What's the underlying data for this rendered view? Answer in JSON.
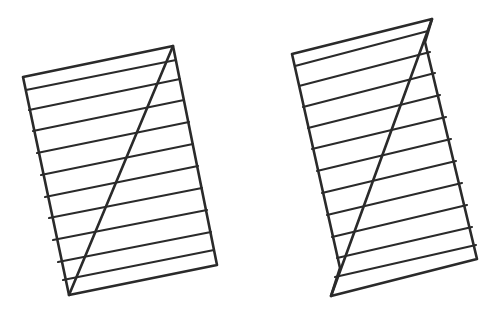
{
  "stroke_color": "#2a2a2a",
  "background": "#ffffff",
  "figures": [
    {
      "name": "left-figure",
      "outline": [
        [
          23,
          77
        ],
        [
          173,
          46
        ],
        [
          217,
          265
        ],
        [
          69,
          295
        ]
      ],
      "diagonal": [
        [
          173,
          46
        ],
        [
          69,
          295
        ]
      ],
      "stripes": [
        [
          [
            26,
            90
          ],
          [
            176,
            60
          ]
        ],
        [
          [
            29,
            110
          ],
          [
            180,
            79
          ]
        ],
        [
          [
            33,
            131
          ],
          [
            184,
            100
          ]
        ],
        [
          [
            37,
            153
          ],
          [
            189,
            122
          ]
        ],
        [
          [
            41,
            175
          ],
          [
            193,
            144
          ]
        ],
        [
          [
            45,
            197
          ],
          [
            198,
            166
          ]
        ],
        [
          [
            49,
            218
          ],
          [
            202,
            188
          ]
        ],
        [
          [
            53,
            240
          ],
          [
            207,
            210
          ]
        ],
        [
          [
            58,
            262
          ],
          [
            211,
            232
          ]
        ],
        [
          [
            63,
            280
          ],
          [
            214,
            250
          ]
        ]
      ]
    },
    {
      "name": "right-figure",
      "outline": [
        [
          292,
          54
        ],
        [
          432,
          19
        ],
        [
          425,
          42
        ],
        [
          477,
          259
        ],
        [
          331,
          296
        ],
        [
          340,
          268
        ],
        [
          292,
          54
        ]
      ],
      "diagonal": [
        [
          432,
          19
        ],
        [
          331,
          296
        ]
      ],
      "stripes": [
        [
          [
            295,
            66
          ],
          [
            428,
            31
          ]
        ],
        [
          [
            299,
            86
          ],
          [
            430,
            52
          ]
        ],
        [
          [
            303,
            107
          ],
          [
            435,
            73
          ]
        ],
        [
          [
            308,
            128
          ],
          [
            440,
            95
          ]
        ],
        [
          [
            312,
            149
          ],
          [
            446,
            117
          ]
        ],
        [
          [
            317,
            171
          ],
          [
            451,
            139
          ]
        ],
        [
          [
            322,
            193
          ],
          [
            456,
            161
          ]
        ],
        [
          [
            327,
            215
          ],
          [
            462,
            183
          ]
        ],
        [
          [
            332,
            237
          ],
          [
            467,
            205
          ]
        ],
        [
          [
            337,
            258
          ],
          [
            472,
            227
          ]
        ],
        [
          [
            335,
            277
          ],
          [
            476,
            245
          ]
        ]
      ]
    }
  ]
}
